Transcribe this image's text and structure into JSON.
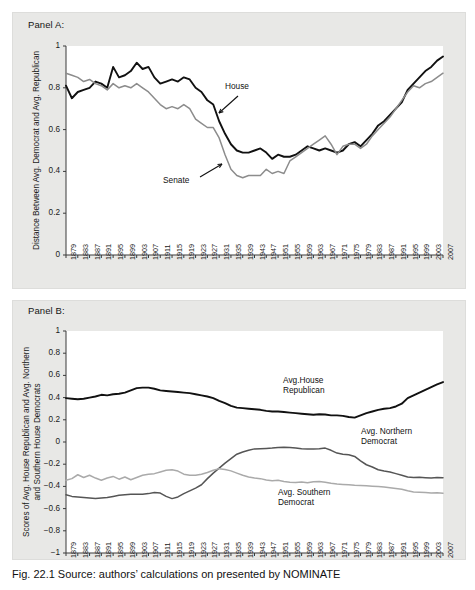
{
  "figure": {
    "caption": "Fig. 22.1   Source: authors’ calculations on presented by NOMINATE"
  },
  "panelA": {
    "label": "Panel A:",
    "ylabel": "Distance Between Avg. Democrat and Avg. Republican",
    "annotations": [
      {
        "name": "house",
        "text": "House"
      },
      {
        "name": "senate",
        "text": "Senate"
      }
    ]
  },
  "panelB": {
    "label": "Panel B:",
    "ylabel_line1": "Scores of Avg. House Republican and Avg. Northern",
    "ylabel_line2": "and Southern House Democrats",
    "annotations": [
      {
        "name": "house-republican",
        "text": "Avg.House\nRepublican"
      },
      {
        "name": "northern-democrat",
        "text": "Avg. Northern\nDemocrat"
      },
      {
        "name": "southern-democrat",
        "text": "Avg. Southern\nDemocrat"
      }
    ]
  },
  "chart_data": [
    {
      "type": "line",
      "name": "panel-a",
      "title": "Panel A:",
      "xlabel": "",
      "ylabel": "Distance Between Avg. Democrat and Avg. Republican",
      "ylim": [
        0,
        1
      ],
      "yticks": [
        0,
        0.2,
        0.4,
        0.6,
        0.8,
        1
      ],
      "ytick_labels": [
        "0",
        "0.2",
        "0.4",
        "0.6",
        "0.8",
        "1"
      ],
      "xlim": [
        1879,
        2007
      ],
      "grid": false,
      "legend": "annotations-inline",
      "x": [
        1879,
        1881,
        1883,
        1885,
        1887,
        1889,
        1891,
        1893,
        1895,
        1897,
        1899,
        1901,
        1903,
        1905,
        1907,
        1909,
        1911,
        1913,
        1915,
        1917,
        1919,
        1921,
        1923,
        1925,
        1927,
        1929,
        1931,
        1933,
        1935,
        1937,
        1939,
        1941,
        1943,
        1945,
        1947,
        1949,
        1951,
        1953,
        1955,
        1957,
        1959,
        1961,
        1963,
        1965,
        1967,
        1969,
        1971,
        1973,
        1975,
        1977,
        1979,
        1981,
        1983,
        1985,
        1987,
        1989,
        1991,
        1993,
        1995,
        1997,
        1999,
        2001,
        2003,
        2005,
        2007
      ],
      "series": [
        {
          "name": "House",
          "color": "#111111",
          "values": [
            0.81,
            0.75,
            0.78,
            0.79,
            0.8,
            0.83,
            0.82,
            0.8,
            0.9,
            0.85,
            0.86,
            0.88,
            0.92,
            0.89,
            0.9,
            0.85,
            0.82,
            0.83,
            0.84,
            0.83,
            0.85,
            0.84,
            0.8,
            0.78,
            0.74,
            0.72,
            0.64,
            0.58,
            0.53,
            0.5,
            0.49,
            0.49,
            0.5,
            0.51,
            0.49,
            0.46,
            0.48,
            0.47,
            0.47,
            0.48,
            0.5,
            0.52,
            0.51,
            0.5,
            0.51,
            0.5,
            0.49,
            0.5,
            0.53,
            0.54,
            0.52,
            0.55,
            0.58,
            0.62,
            0.64,
            0.67,
            0.7,
            0.73,
            0.79,
            0.82,
            0.85,
            0.88,
            0.9,
            0.93,
            0.95
          ]
        },
        {
          "name": "Senate",
          "color": "#8c8c8c",
          "values": [
            0.87,
            0.86,
            0.85,
            0.83,
            0.84,
            0.82,
            0.81,
            0.79,
            0.82,
            0.8,
            0.81,
            0.8,
            0.82,
            0.8,
            0.78,
            0.75,
            0.72,
            0.7,
            0.71,
            0.7,
            0.72,
            0.7,
            0.65,
            0.63,
            0.61,
            0.61,
            0.56,
            0.48,
            0.41,
            0.38,
            0.37,
            0.38,
            0.38,
            0.38,
            0.41,
            0.39,
            0.4,
            0.39,
            0.45,
            0.47,
            0.49,
            0.51,
            0.53,
            0.55,
            0.57,
            0.53,
            0.48,
            0.52,
            0.53,
            0.53,
            0.51,
            0.53,
            0.57,
            0.6,
            0.63,
            0.66,
            0.7,
            0.74,
            0.78,
            0.81,
            0.8,
            0.82,
            0.83,
            0.85,
            0.87
          ]
        }
      ]
    },
    {
      "type": "line",
      "name": "panel-b",
      "title": "Panel B:",
      "xlabel": "",
      "ylabel": "Scores of Avg. House Republican and Avg. Northern and Southern House Democrats",
      "ylim": [
        -1,
        1
      ],
      "yticks": [
        -1,
        -0.8,
        -0.6,
        -0.4,
        -0.2,
        0,
        0.2,
        0.4,
        0.6,
        0.8,
        1
      ],
      "ytick_labels": [
        "−1",
        "−0.8",
        "−0.6",
        "−0.4",
        "−0.2",
        "0",
        "0.2",
        "0.4",
        "0.6",
        "0.8",
        "1"
      ],
      "xlim": [
        1879,
        2007
      ],
      "grid": false,
      "legend": "annotations-inline",
      "x": [
        1879,
        1881,
        1883,
        1885,
        1887,
        1889,
        1891,
        1893,
        1895,
        1897,
        1899,
        1901,
        1903,
        1905,
        1907,
        1909,
        1911,
        1913,
        1915,
        1917,
        1919,
        1921,
        1923,
        1925,
        1927,
        1929,
        1931,
        1933,
        1935,
        1937,
        1939,
        1941,
        1943,
        1945,
        1947,
        1949,
        1951,
        1953,
        1955,
        1957,
        1959,
        1961,
        1963,
        1965,
        1967,
        1969,
        1971,
        1973,
        1975,
        1977,
        1979,
        1981,
        1983,
        1985,
        1987,
        1989,
        1991,
        1993,
        1995,
        1997,
        1999,
        2001,
        2003,
        2005,
        2007
      ],
      "series": [
        {
          "name": "Avg.House Republican",
          "color": "#111111",
          "values": [
            0.395,
            0.39,
            0.385,
            0.39,
            0.4,
            0.41,
            0.425,
            0.42,
            0.43,
            0.435,
            0.445,
            0.465,
            0.485,
            0.49,
            0.49,
            0.48,
            0.465,
            0.46,
            0.455,
            0.45,
            0.445,
            0.44,
            0.43,
            0.42,
            0.41,
            0.395,
            0.37,
            0.35,
            0.325,
            0.31,
            0.305,
            0.3,
            0.295,
            0.29,
            0.28,
            0.275,
            0.275,
            0.27,
            0.265,
            0.26,
            0.255,
            0.25,
            0.245,
            0.25,
            0.248,
            0.24,
            0.24,
            0.235,
            0.225,
            0.22,
            0.24,
            0.26,
            0.275,
            0.29,
            0.3,
            0.305,
            0.32,
            0.345,
            0.395,
            0.42,
            0.445,
            0.47,
            0.495,
            0.52,
            0.54
          ]
        },
        {
          "name": "Avg. Northern Democrat",
          "color": "#555555",
          "values": [
            -0.475,
            -0.49,
            -0.495,
            -0.5,
            -0.505,
            -0.51,
            -0.505,
            -0.5,
            -0.49,
            -0.48,
            -0.475,
            -0.47,
            -0.47,
            -0.47,
            -0.465,
            -0.455,
            -0.46,
            -0.49,
            -0.51,
            -0.495,
            -0.465,
            -0.44,
            -0.415,
            -0.385,
            -0.33,
            -0.28,
            -0.235,
            -0.19,
            -0.15,
            -0.11,
            -0.09,
            -0.075,
            -0.062,
            -0.06,
            -0.058,
            -0.055,
            -0.05,
            -0.047,
            -0.05,
            -0.055,
            -0.06,
            -0.063,
            -0.062,
            -0.06,
            -0.055,
            -0.075,
            -0.1,
            -0.11,
            -0.115,
            -0.13,
            -0.17,
            -0.205,
            -0.225,
            -0.25,
            -0.262,
            -0.27,
            -0.285,
            -0.3,
            -0.315,
            -0.32,
            -0.318,
            -0.322,
            -0.325,
            -0.32,
            -0.322
          ]
        },
        {
          "name": "Avg. Southern Democrat",
          "color": "#aaaaaa",
          "values": [
            -0.345,
            -0.33,
            -0.295,
            -0.32,
            -0.3,
            -0.325,
            -0.345,
            -0.325,
            -0.31,
            -0.335,
            -0.315,
            -0.34,
            -0.32,
            -0.3,
            -0.29,
            -0.285,
            -0.27,
            -0.255,
            -0.25,
            -0.262,
            -0.29,
            -0.3,
            -0.3,
            -0.29,
            -0.275,
            -0.255,
            -0.24,
            -0.248,
            -0.26,
            -0.28,
            -0.3,
            -0.315,
            -0.325,
            -0.33,
            -0.342,
            -0.348,
            -0.345,
            -0.355,
            -0.362,
            -0.365,
            -0.36,
            -0.368,
            -0.358,
            -0.355,
            -0.362,
            -0.372,
            -0.378,
            -0.382,
            -0.386,
            -0.39,
            -0.392,
            -0.395,
            -0.398,
            -0.4,
            -0.405,
            -0.412,
            -0.418,
            -0.425,
            -0.44,
            -0.45,
            -0.452,
            -0.455,
            -0.46,
            -0.458,
            -0.462
          ]
        }
      ]
    }
  ],
  "axis": {
    "xtick_labels": [
      "1879",
      "1883",
      "1887",
      "1891",
      "1895",
      "1899",
      "1903",
      "1907",
      "1911",
      "1915",
      "1919",
      "1923",
      "1927",
      "1931",
      "1935",
      "1939",
      "1943",
      "1947",
      "1951",
      "1955",
      "1959",
      "1963",
      "1967",
      "1971",
      "1975",
      "1979",
      "1983",
      "1987",
      "1991",
      "1995",
      "1999",
      "2003",
      "2007"
    ]
  }
}
